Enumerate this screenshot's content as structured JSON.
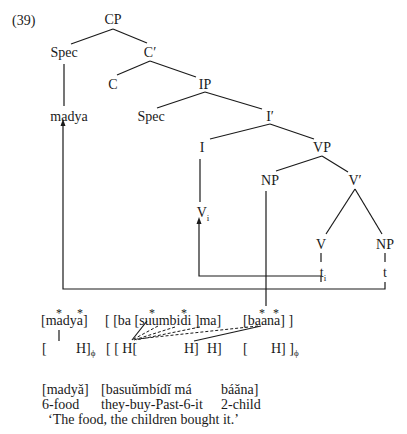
{
  "example_number": "(39)",
  "tree": {
    "nodes": {
      "cp": "CP",
      "spec_cp": "Spec",
      "c_bar": "C′",
      "c": "C",
      "ip": "IP",
      "madya": "madya",
      "spec_ip": "Spec",
      "i_bar": "I′",
      "i": "I",
      "vp": "VP",
      "np_subj": "NP",
      "v_bar": "V′",
      "v_i": "V",
      "v_i_sub": "i",
      "v": "V",
      "np_obj": "NP",
      "t_i": "t",
      "t_i_sub": "i",
      "t": "t"
    }
  },
  "tonal_rows": {
    "stars": [
      "*",
      "*",
      "*",
      "*",
      "*",
      "*"
    ],
    "segments": {
      "madya": "[madya]",
      "verb_open": "[ [ba [suumbidi ]ma]",
      "baana": "[baana] ]"
    },
    "tones": {
      "phi1_open": "[",
      "phi1_h": "H]",
      "phi_sub": "ϕ",
      "verb_tones": "[ [  H[",
      "h2": "H]",
      "h3": "H]",
      "phi2_open": "[",
      "phi2_h": "H] ]"
    }
  },
  "gloss": {
    "surface": [
      "[madyǎ]",
      "[basuǔmbídǐ má",
      "báǎna]"
    ],
    "morph": [
      "6-food",
      "they-buy-Past-6-it",
      "2-child"
    ],
    "translation": "‘The food, the children bought it.’"
  }
}
